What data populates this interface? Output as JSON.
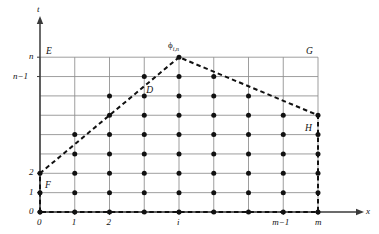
{
  "figure": {
    "type": "lattice-domain-diagram",
    "background": "#ffffff",
    "axes": {
      "x_axis_label": "x",
      "y_axis_label": "t",
      "x_ticks": [
        "0",
        "1",
        "2",
        "i",
        "m−1",
        "m"
      ],
      "y_ticks": [
        "0",
        "1",
        "2",
        "n−1",
        "n"
      ]
    },
    "point_labels": {
      "E": "E",
      "F": "F",
      "G": "G",
      "H": "H",
      "D": "D",
      "apex": "ϕ",
      "apex_sub": "i,n"
    },
    "colors": {
      "grid": "#8c8c8c",
      "axis": "#3a3a3a",
      "dashed": "#111111",
      "dot": "#111111",
      "text": "#111111"
    }
  },
  "chart_data": {
    "type": "scatter",
    "title": "",
    "xlabel": "x",
    "ylabel": "t",
    "grid": true,
    "legend": null,
    "xlim": [
      0,
      8
    ],
    "ylim": [
      0,
      8
    ],
    "xtick_positions": [
      0,
      1,
      2,
      4,
      7,
      8
    ],
    "xtick_labels": [
      "0",
      "1",
      "2",
      "i",
      "m−1",
      "m"
    ],
    "ytick_positions": [
      0,
      1,
      2,
      7,
      8
    ],
    "ytick_labels": [
      "0",
      "1",
      "2",
      "n−1",
      "n"
    ],
    "grid_columns": [
      0,
      1,
      2,
      3,
      4,
      5,
      6,
      7,
      8
    ],
    "grid_rows": [
      0,
      1,
      2,
      3,
      4,
      5,
      6,
      7,
      8
    ],
    "apex": {
      "x": 4,
      "y": 8,
      "label": "ϕ",
      "sublabel": "i,n"
    },
    "boundary_polyline": [
      {
        "x": 0,
        "y": 0
      },
      {
        "x": 0,
        "y": 2
      },
      {
        "x": 4,
        "y": 8
      },
      {
        "x": 8,
        "y": 5
      },
      {
        "x": 8,
        "y": 0
      },
      {
        "x": 0,
        "y": 0
      }
    ],
    "boundary_style": "dashed",
    "named_points": [
      {
        "name": "E",
        "x": 0,
        "y": 8,
        "label_dx": 6,
        "label_dy": 10
      },
      {
        "name": "F",
        "x": 0,
        "y": 2,
        "label_dx": 5,
        "label_dy": -8
      },
      {
        "name": "G",
        "x": 8,
        "y": 8,
        "label_dx": -12,
        "label_dy": 10
      },
      {
        "name": "H",
        "x": 8,
        "y": 5,
        "label_dx": -13,
        "label_dy": -9
      },
      {
        "name": "D",
        "x": 3,
        "y": 7,
        "label_dx": 2,
        "label_dy": -9
      }
    ],
    "lattice_points": [
      {
        "x": 0,
        "y": 0
      },
      {
        "x": 1,
        "y": 0
      },
      {
        "x": 2,
        "y": 0
      },
      {
        "x": 3,
        "y": 0
      },
      {
        "x": 4,
        "y": 0
      },
      {
        "x": 5,
        "y": 0
      },
      {
        "x": 6,
        "y": 0
      },
      {
        "x": 7,
        "y": 0
      },
      {
        "x": 8,
        "y": 0
      },
      {
        "x": 0,
        "y": 1
      },
      {
        "x": 1,
        "y": 1
      },
      {
        "x": 2,
        "y": 1
      },
      {
        "x": 3,
        "y": 1
      },
      {
        "x": 4,
        "y": 1
      },
      {
        "x": 5,
        "y": 1
      },
      {
        "x": 6,
        "y": 1
      },
      {
        "x": 7,
        "y": 1
      },
      {
        "x": 8,
        "y": 1
      },
      {
        "x": 0,
        "y": 2
      },
      {
        "x": 1,
        "y": 2
      },
      {
        "x": 2,
        "y": 2
      },
      {
        "x": 3,
        "y": 2
      },
      {
        "x": 4,
        "y": 2
      },
      {
        "x": 5,
        "y": 2
      },
      {
        "x": 6,
        "y": 2
      },
      {
        "x": 7,
        "y": 2
      },
      {
        "x": 8,
        "y": 2
      },
      {
        "x": 1,
        "y": 3
      },
      {
        "x": 2,
        "y": 3
      },
      {
        "x": 3,
        "y": 3
      },
      {
        "x": 4,
        "y": 3
      },
      {
        "x": 5,
        "y": 3
      },
      {
        "x": 6,
        "y": 3
      },
      {
        "x": 7,
        "y": 3
      },
      {
        "x": 8,
        "y": 3
      },
      {
        "x": 1,
        "y": 4
      },
      {
        "x": 2,
        "y": 4
      },
      {
        "x": 3,
        "y": 4
      },
      {
        "x": 4,
        "y": 4
      },
      {
        "x": 5,
        "y": 4
      },
      {
        "x": 6,
        "y": 4
      },
      {
        "x": 7,
        "y": 4
      },
      {
        "x": 8,
        "y": 4
      },
      {
        "x": 2,
        "y": 5
      },
      {
        "x": 3,
        "y": 5
      },
      {
        "x": 4,
        "y": 5
      },
      {
        "x": 5,
        "y": 5
      },
      {
        "x": 6,
        "y": 5
      },
      {
        "x": 7,
        "y": 5
      },
      {
        "x": 8,
        "y": 5
      },
      {
        "x": 2,
        "y": 6
      },
      {
        "x": 3,
        "y": 6
      },
      {
        "x": 4,
        "y": 6
      },
      {
        "x": 5,
        "y": 6
      },
      {
        "x": 6,
        "y": 6
      },
      {
        "x": 3,
        "y": 7
      },
      {
        "x": 4,
        "y": 7
      },
      {
        "x": 5,
        "y": 7
      },
      {
        "x": 4,
        "y": 8
      }
    ]
  }
}
